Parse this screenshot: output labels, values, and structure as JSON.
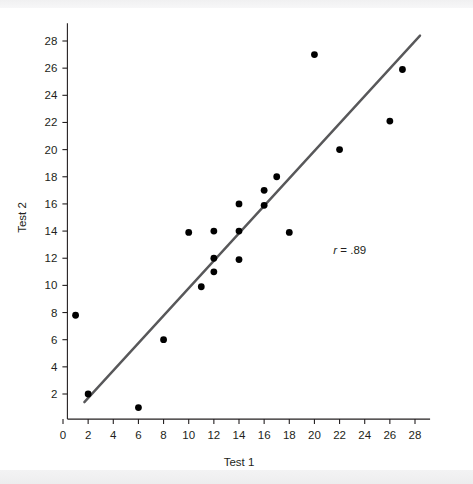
{
  "figure": {
    "background_color": "#ffffff",
    "band_color": "#f1f1f2",
    "axis_color": "#231f20",
    "point_color": "#000000",
    "line_color": "#58585a"
  },
  "chart_data": {
    "type": "scatter",
    "title": "",
    "xlabel": "Test 1",
    "ylabel": "Test 2",
    "xlim": [
      0,
      29
    ],
    "ylim": [
      0,
      29
    ],
    "xticks": [
      0,
      2,
      4,
      6,
      8,
      10,
      12,
      14,
      16,
      18,
      20,
      22,
      24,
      26,
      28
    ],
    "yticks": [
      2,
      4,
      6,
      8,
      10,
      12,
      14,
      16,
      18,
      20,
      22,
      24,
      26,
      28
    ],
    "xtick_labels": [
      "0",
      "2",
      "4",
      "6",
      "8",
      "10",
      "12",
      "14",
      "16",
      "18",
      "20",
      "22",
      "24",
      "26",
      "28"
    ],
    "ytick_labels": [
      "2",
      "4",
      "6",
      "8",
      "10",
      "12",
      "14",
      "16",
      "18",
      "20",
      "22",
      "24",
      "26",
      "28"
    ],
    "grid": false,
    "legend": null,
    "points": [
      {
        "x": 1,
        "y": 7.8
      },
      {
        "x": 2,
        "y": 2.0
      },
      {
        "x": 6,
        "y": 1.0
      },
      {
        "x": 8,
        "y": 6.0
      },
      {
        "x": 10,
        "y": 13.9
      },
      {
        "x": 11,
        "y": 9.9
      },
      {
        "x": 12,
        "y": 11.0
      },
      {
        "x": 12,
        "y": 12.0
      },
      {
        "x": 12,
        "y": 14.0
      },
      {
        "x": 14,
        "y": 11.9
      },
      {
        "x": 14,
        "y": 14.0
      },
      {
        "x": 14,
        "y": 16.0
      },
      {
        "x": 16,
        "y": 15.9
      },
      {
        "x": 16,
        "y": 17.0
      },
      {
        "x": 17,
        "y": 18.0
      },
      {
        "x": 18,
        "y": 13.9
      },
      {
        "x": 20,
        "y": 27.0
      },
      {
        "x": 22,
        "y": 20.0
      },
      {
        "x": 26,
        "y": 22.1
      },
      {
        "x": 27,
        "y": 25.9
      }
    ],
    "regression_line": {
      "x0": 1.7,
      "y0": 1.4,
      "x1": 28.4,
      "y1": 28.4
    },
    "annotations": [
      {
        "name": "correlation",
        "symbol": "r",
        "text": " = .89",
        "x": 21.5,
        "y": 12.3
      }
    ]
  },
  "axis_titles": {
    "x": "Test 1",
    "y": "Test 2"
  }
}
